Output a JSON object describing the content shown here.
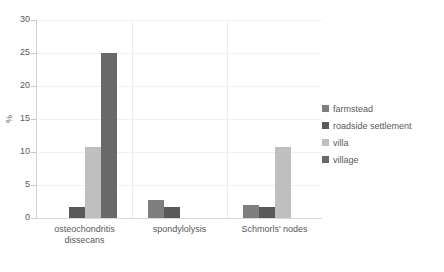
{
  "chart_data": {
    "type": "bar",
    "title": "",
    "xlabel": "",
    "ylabel": "%",
    "ylim": [
      0,
      30
    ],
    "ytick_step": 5,
    "yticks": [
      "30",
      "25",
      "20",
      "15",
      "10",
      "5",
      "0"
    ],
    "grid": true,
    "legend_position": "right",
    "categories": [
      "osteochondritis dissecans",
      "spondylolysis",
      "Schmorls' nodes"
    ],
    "category_lines": [
      [
        "osteochondritis",
        "dissecans"
      ],
      [
        "spondylolysis"
      ],
      [
        "Schmorls' nodes"
      ]
    ],
    "series": [
      {
        "name": "farmstead",
        "color": "#7f7f7f",
        "values": [
          0,
          2.7,
          2.0
        ]
      },
      {
        "name": "roadside settlement",
        "color": "#595959",
        "values": [
          1.6,
          1.6,
          1.6
        ]
      },
      {
        "name": "villa",
        "color": "#bfbfbf",
        "values": [
          10.7,
          0,
          10.7
        ]
      },
      {
        "name": "village",
        "color": "#696969",
        "values": [
          25,
          0,
          0
        ]
      }
    ]
  },
  "legend": {
    "items": [
      {
        "label": "farmstead",
        "color": "#7f7f7f"
      },
      {
        "label": "roadside settlement",
        "color": "#595959"
      },
      {
        "label": "villa",
        "color": "#bfbfbf"
      },
      {
        "label": "village",
        "color": "#696969"
      }
    ]
  },
  "axis": {
    "y_title": "%",
    "y_labels": [
      "30",
      "25",
      "20",
      "15",
      "10",
      "5",
      "0"
    ]
  }
}
